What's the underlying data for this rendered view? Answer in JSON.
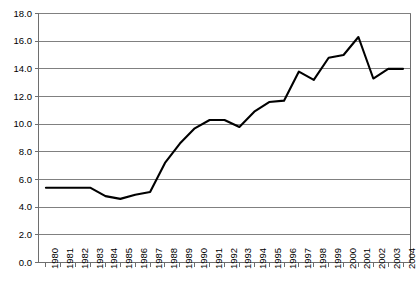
{
  "chart_data": {
    "type": "line",
    "title": "",
    "subtitle": "",
    "xlabel": "",
    "ylabel": "",
    "categories": [
      "1980",
      "1981",
      "1982",
      "1983",
      "1984",
      "1985",
      "1986",
      "1987",
      "1988",
      "1989",
      "1990",
      "1991",
      "1992",
      "1993",
      "1994",
      "1995",
      "1996",
      "1997",
      "1998",
      "1999",
      "2000",
      "2001",
      "2002",
      "2003",
      "2004"
    ],
    "values": [
      5.4,
      5.4,
      5.4,
      5.4,
      4.8,
      4.6,
      4.9,
      5.1,
      7.2,
      8.6,
      9.7,
      10.3,
      10.3,
      9.8,
      10.9,
      11.6,
      11.7,
      13.8,
      13.2,
      14.8,
      15.0,
      16.3,
      13.3,
      14.0,
      14.0
    ],
    "series": [
      {
        "name": "series-1",
        "values": [
          5.4,
          5.4,
          5.4,
          5.4,
          4.8,
          4.6,
          4.9,
          5.1,
          7.2,
          8.6,
          9.7,
          10.3,
          10.3,
          9.8,
          10.9,
          11.6,
          11.7,
          13.8,
          13.2,
          14.8,
          15.0,
          16.3,
          13.3,
          14.0,
          14.0
        ],
        "color": "#000000"
      }
    ],
    "ylim": [
      0.0,
      18.0
    ],
    "yticks": [
      "0.0",
      "2.0",
      "4.0",
      "6.0",
      "8.0",
      "10.0",
      "12.0",
      "14.0",
      "16.0",
      "18.0"
    ],
    "ytick_values": [
      0.0,
      2.0,
      4.0,
      6.0,
      8.0,
      10.0,
      12.0,
      14.0,
      16.0,
      18.0
    ],
    "grid": "horizontal",
    "legend": "none",
    "line_color": "#000000",
    "grid_color": "#808080",
    "axis_color": "#6e6e6e",
    "background": "#ffffff"
  },
  "axes": {
    "y_axis_name": "y-axis",
    "x_axis_name": "x-axis"
  }
}
